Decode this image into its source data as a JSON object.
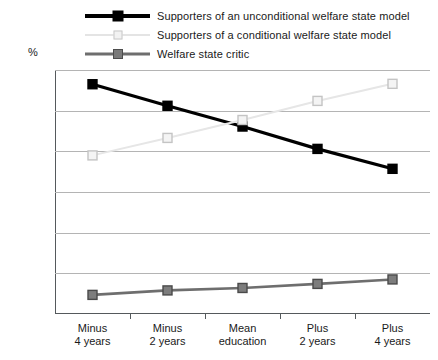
{
  "legend": {
    "position": "top",
    "items": [
      {
        "label": "Supporters of an unconditional welfare state model",
        "key": "s1",
        "color": "#000000"
      },
      {
        "label": "Supporters of a conditional welfare state model",
        "key": "s2",
        "color": "#e4e4e4"
      },
      {
        "label": "Welfare state critic",
        "key": "s3",
        "color": "#7a7a7a"
      }
    ]
  },
  "axis": {
    "y_unit_label": "%",
    "y_ticks": [
      "0.60",
      "0.50",
      "0.40",
      "0.30",
      "0.20",
      "0.10",
      "0"
    ],
    "x_labels": [
      {
        "line1": "Minus",
        "line2": "4 years"
      },
      {
        "line1": "Minus",
        "line2": "2 years"
      },
      {
        "line1": "Mean",
        "line2": "education"
      },
      {
        "line1": "Plus",
        "line2": "2 years"
      },
      {
        "line1": "Plus",
        "line2": "4 years"
      }
    ]
  },
  "chart_data": {
    "type": "line",
    "title": "",
    "subtitle": "",
    "xlabel": "",
    "ylabel": "%",
    "ylim": [
      0,
      0.6
    ],
    "ytick_values": [
      0,
      0.1,
      0.2,
      0.3,
      0.4,
      0.5,
      0.6
    ],
    "grid": true,
    "legend_position": "top",
    "categories": [
      "Minus 4 years",
      "Minus 2 years",
      "Mean education",
      "Plus 2 years",
      "Plus 4 years"
    ],
    "series": [
      {
        "name": "Supporters of an unconditional welfare state model",
        "color": "#000000",
        "marker": "filled-square",
        "values": [
          0.565,
          0.512,
          0.461,
          0.406,
          0.357
        ]
      },
      {
        "name": "Supporters of a conditional welfare state model",
        "color": "#e4e4e4",
        "marker": "open-square",
        "values": [
          0.39,
          0.433,
          0.477,
          0.524,
          0.566
        ]
      },
      {
        "name": "Welfare state critic",
        "color": "#7a7a7a",
        "marker": "filled-square",
        "values": [
          0.047,
          0.058,
          0.064,
          0.074,
          0.085
        ]
      }
    ]
  }
}
